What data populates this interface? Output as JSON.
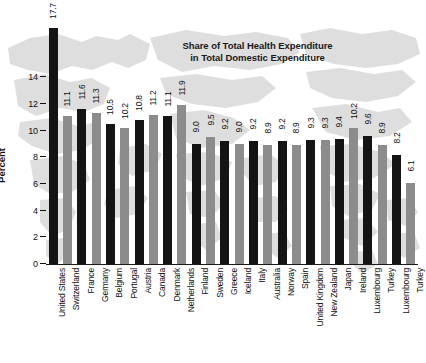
{
  "chart_data": {
    "type": "bar",
    "title": "Share of Total Health Expenditure in Total Domestic Expenditure",
    "title_line1": "Share of Total Health Expenditure",
    "title_line2": "in Total Domestic Expenditure",
    "xlabel": "",
    "ylabel": "Percent",
    "ylim": [
      0,
      18
    ],
    "yticks": [
      0,
      2,
      4,
      6,
      8,
      10,
      12,
      14
    ],
    "ytick_labels": [
      "0",
      "2",
      "4",
      "6",
      "8",
      "10",
      "12",
      "14"
    ],
    "grid": false,
    "legend": "none",
    "categories": [
      "United States",
      "Switzerland",
      "France",
      "Germany",
      "Belgium",
      "Portugal",
      "Austria",
      "Canada",
      "Denmark",
      "Netherlands",
      "Finland",
      "Sweden",
      "Greece",
      "Iceland",
      "Italy",
      "Australia",
      "Norway",
      "Spain",
      "United Kingdom",
      "New Zealand",
      "Japan",
      "Ireland",
      "Luxembourg",
      "Turkey"
    ],
    "values": [
      17.7,
      11.1,
      11.6,
      11.3,
      10.5,
      10.2,
      10.8,
      11.2,
      11.1,
      11.9,
      9.0,
      9.5,
      9.2,
      9.0,
      9.2,
      8.9,
      9.2,
      8.9,
      9.3,
      9.3,
      9.4,
      10.2,
      9.6,
      8.9
    ],
    "value_labels": [
      "17.7",
      "11.1",
      "11.6",
      "11.3",
      "10.5",
      "10.2",
      "10.8",
      "11.2",
      "11.1",
      "11.9",
      "9.0",
      "9.5",
      "9.2",
      "9.0",
      "9.2",
      "8.9",
      "9.2",
      "8.9",
      "9.3",
      "9.3",
      "9.4",
      "10.2",
      "9.6",
      "8.9"
    ],
    "colors": {
      "dark": "#141414",
      "gray": "#8c8c8c",
      "background_map": "#dedede",
      "axis": "#111111"
    },
    "bar_color_pattern": "alternating dark/gray starting dark"
  },
  "extra_bars": {
    "note": "chart shows 25 bars total",
    "last_two": {
      "labels": [
        "Luxembourg",
        "Turkey"
      ],
      "values": [
        8.2,
        6.1
      ]
    }
  }
}
